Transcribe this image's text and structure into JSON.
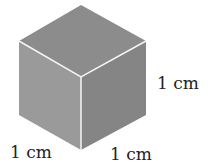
{
  "diagram": {
    "type": "unit cube",
    "labels": {
      "right_edge": "1 cm",
      "bottom_left_edge": "1 cm",
      "bottom_right_edge": "1 cm"
    },
    "colors": {
      "top_face": "#8c8c8c",
      "left_face": "#9a9a9a",
      "right_face": "#858585",
      "edge_highlight": "#f4f4f4",
      "text": "#222222"
    }
  }
}
